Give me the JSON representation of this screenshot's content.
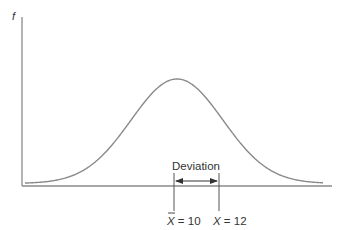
{
  "diagram": {
    "type": "normal-distribution-deviation",
    "y_axis_label": "f",
    "deviation_label": "Deviation",
    "mean_label": {
      "symbol": "X",
      "overbar": true,
      "text": " = 10"
    },
    "value_label": {
      "symbol": "X",
      "overbar": false,
      "text": " = 12"
    },
    "mean_value": 10,
    "observation_value": 12,
    "colors": {
      "axis": "#8a8a8a",
      "curve": "#8a8a8a",
      "marker": "#555555",
      "arrow": "#333333",
      "text": "#333333"
    }
  }
}
